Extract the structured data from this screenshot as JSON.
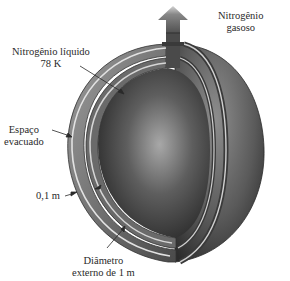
{
  "diagram": {
    "labels": {
      "gas": {
        "line1": "Nitrogênio",
        "line2": "gasoso"
      },
      "liquid": {
        "line1": "Nitrogênio líquido",
        "line2": "78 K"
      },
      "vacuum": {
        "line1": "Espaço",
        "line2": "evacuado"
      },
      "thickness": {
        "line1": "0,1 m"
      },
      "diameter": {
        "line1": "Diâmetro",
        "line2": "externo de 1 m"
      }
    },
    "colors": {
      "background": "#ffffff",
      "text": "#2a2a2a",
      "shell_dark": "#3a3a3a",
      "shell_light": "#c8c8c8",
      "core_highlight": "#9a9a9a",
      "core_dark": "#2e2e2e"
    }
  }
}
